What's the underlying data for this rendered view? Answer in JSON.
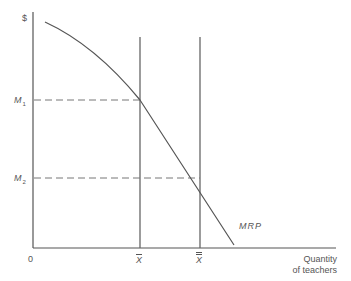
{
  "diagram": {
    "y_axis_label": "$",
    "x_axis_label_line1": "Quantity",
    "x_axis_label_line2": "of teachers",
    "origin_label": "0",
    "y_ticks": [
      {
        "base": "M",
        "sub": "1"
      },
      {
        "base": "M",
        "sub": "2"
      }
    ],
    "x_ticks": [
      {
        "label": "X",
        "bars": 1
      },
      {
        "label": "X",
        "bars": 2
      }
    ],
    "curve_label": "MRP",
    "colors": {
      "line": "#555555",
      "dash": "#666666",
      "background": "#ffffff"
    }
  }
}
